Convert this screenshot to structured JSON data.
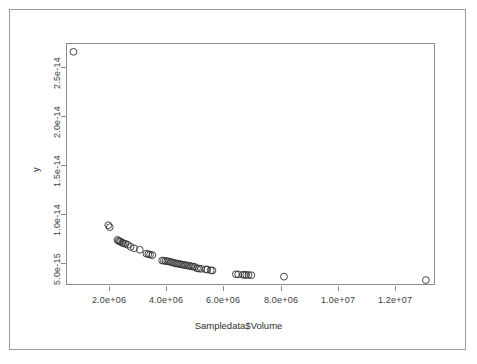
{
  "chart_data": {
    "type": "scatter",
    "title": "",
    "xlabel": "Sampledata$Volume",
    "ylabel": "y",
    "grid": false,
    "legend": null,
    "xlim": [
      500000,
      13400000
    ],
    "ylim": [
      2.8e-15,
      2.75e-14
    ],
    "xticks": [
      2000000,
      4000000,
      6000000,
      8000000,
      10000000,
      12000000
    ],
    "xtick_labels": [
      "2.0e+06",
      "4.0e+06",
      "6.0e+06",
      "8.0e+06",
      "1.0e+07",
      "1.2e+07"
    ],
    "yticks": [
      5e-15,
      1e-14,
      1.5e-14,
      2e-14,
      2.5e-14
    ],
    "ytick_labels": [
      "5.0e-15",
      "1.0e-14",
      "1.5e-14",
      "2.0e-14",
      "2.5e-14"
    ],
    "marker": "open-circle",
    "marker_color": "#333333",
    "marker_size": 3.4,
    "point_count": 64,
    "x": [
      760000,
      1980000,
      2030000,
      2300000,
      2340000,
      2380000,
      2420000,
      2470000,
      2520000,
      2580000,
      2660000,
      2760000,
      2880000,
      3080000,
      3310000,
      3380000,
      3440000,
      3520000,
      3860000,
      3920000,
      3980000,
      4040000,
      4100000,
      4160000,
      4220000,
      4280000,
      4340000,
      4400000,
      4460000,
      4520000,
      4580000,
      4640000,
      4700000,
      4760000,
      4820000,
      4880000,
      4940000,
      5000000,
      5080000,
      5140000,
      5220000,
      5380000,
      5440000,
      5560000,
      5620000,
      6440000,
      6520000,
      6680000,
      6740000,
      6800000,
      6880000,
      6980000,
      8120000,
      13080000
    ],
    "y": [
      2.66e-14,
      8.9e-15,
      8.7e-15,
      7.4e-15,
      7.3e-15,
      7.25e-15,
      7.2e-15,
      7.1e-15,
      7.05e-15,
      7e-15,
      6.9e-15,
      6.7e-15,
      6.55e-15,
      6.4e-15,
      6e-15,
      5.95e-15,
      5.9e-15,
      5.85e-15,
      5.3e-15,
      5.28e-15,
      5.25e-15,
      5.22e-15,
      5.2e-15,
      5.15e-15,
      5.1e-15,
      5.05e-15,
      5e-15,
      4.98e-15,
      4.95e-15,
      4.9e-15,
      4.88e-15,
      4.85e-15,
      4.8e-15,
      4.78e-15,
      4.75e-15,
      4.7e-15,
      4.68e-15,
      4.65e-15,
      4.5e-15,
      4.48e-15,
      4.45e-15,
      4.4e-15,
      4.38e-15,
      4.3e-15,
      4.28e-15,
      3.9e-15,
      3.88e-15,
      3.85e-15,
      3.84e-15,
      3.83e-15,
      3.82e-15,
      3.8e-15,
      3.65e-15,
      3.3e-15
    ]
  },
  "axes": {
    "x_title": "Sampledata$Volume",
    "y_title": "y"
  }
}
